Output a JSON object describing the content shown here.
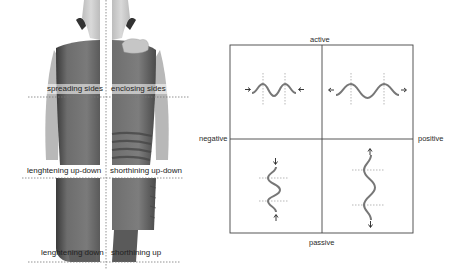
{
  "figure": {
    "left_panel": {
      "description": "photograph of torso split into left/right halves showing garment deformation",
      "labels": {
        "spreading_sides": "spreading sides",
        "enclosing_sides": "enclosing sides",
        "lengthening_up_down": "lenghtening  up-down",
        "shortening_up_down": "shorthining up-down",
        "lengthening_down": "lenghtening down",
        "shortening_up": "shorthining up"
      }
    },
    "right_panel": {
      "axis_labels": {
        "top": "active",
        "bottom": "passive",
        "left": "negative",
        "right": "positive"
      },
      "quadrants": [
        {
          "position": "top-left",
          "wave": "horizontal-compressed",
          "arrows": "inward"
        },
        {
          "position": "top-right",
          "wave": "horizontal-stretched",
          "arrows": "outward"
        },
        {
          "position": "bottom-left",
          "wave": "vertical-compressed",
          "arrows": "inward"
        },
        {
          "position": "bottom-right",
          "wave": "vertical-stretched",
          "arrows": "outward"
        }
      ],
      "colors": {
        "frame": "#444444",
        "wave": "#777777",
        "guide": "#888888"
      }
    }
  }
}
